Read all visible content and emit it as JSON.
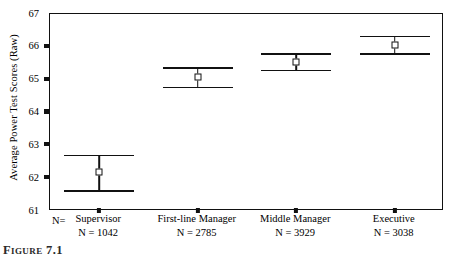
{
  "chart_data": {
    "type": "scatter",
    "title": "",
    "xlabel": "",
    "ylabel": "Average Power Test Scores (Raw)",
    "ylim": [
      61,
      67
    ],
    "yticks": [
      67,
      66,
      65,
      64,
      63,
      62,
      61
    ],
    "ytick_labels": [
      "67",
      "66",
      "65",
      "64",
      "63",
      "62",
      "61"
    ],
    "grid": false,
    "legend": "none",
    "n_row_label": "N=",
    "categories": [
      "Supervisor",
      "First-line Manager",
      "Middle Manager",
      "Executive"
    ],
    "category_n_labels": [
      "N = 1042",
      "N = 2785",
      "N = 3929",
      "N = 3038"
    ],
    "category_n_values": [
      1042,
      2785,
      3929,
      3038
    ],
    "series": [
      {
        "name": "Mean Power Test Score with 95% CI",
        "values": [
          62.2,
          65.08,
          65.55,
          66.07
        ],
        "ci_lower": [
          61.64,
          64.78,
          65.3,
          65.8
        ],
        "ci_upper": [
          62.72,
          65.38,
          65.8,
          66.34
        ]
      }
    ],
    "marker": "open-square",
    "line_color": "#111111",
    "marker_face_color": "#ffffff"
  },
  "caption": {
    "text": "Figure 7.1"
  }
}
